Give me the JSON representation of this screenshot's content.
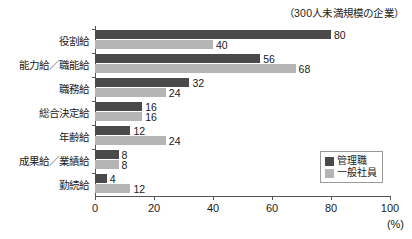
{
  "chart_data": {
    "type": "bar",
    "orientation": "horizontal",
    "title": "（300人未満規模の企業）",
    "xlabel": "(%)",
    "ylabel": "",
    "xlim": [
      0,
      100
    ],
    "xticks": [
      0,
      20,
      40,
      60,
      80,
      100
    ],
    "grid": false,
    "legend_position": "bottom-right",
    "categories": [
      "役割給",
      "能力給／職能給",
      "職務給",
      "総合決定給",
      "年齢給",
      "成果給／業績給",
      "勤続給"
    ],
    "series": [
      {
        "name": "管理職",
        "color": "#4a4a4a",
        "values": [
          80,
          56,
          32,
          16,
          12,
          8,
          4
        ]
      },
      {
        "name": "一般社員",
        "color": "#b5b5b5",
        "values": [
          40,
          68,
          24,
          16,
          24,
          8,
          12
        ]
      }
    ]
  }
}
